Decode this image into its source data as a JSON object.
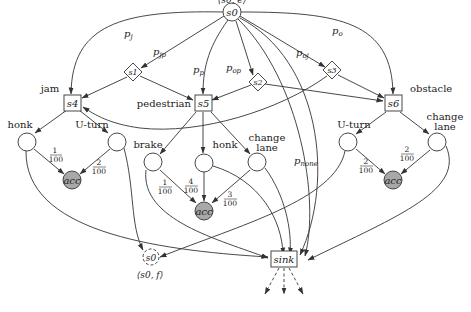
{
  "diagram": {
    "colors": {
      "stroke": "#333333",
      "acc_fill": "#a8a8a8",
      "background": "#ffffff"
    },
    "nodes": {
      "s0": {
        "label": "s0",
        "annotation": "⟨s0, e⟩",
        "shape": "circle"
      },
      "s1": {
        "label": "s1",
        "shape": "diamond"
      },
      "s2": {
        "label": "s2",
        "shape": "diamond"
      },
      "s3": {
        "label": "s3",
        "shape": "diamond"
      },
      "s4": {
        "label": "s4",
        "annotation": "jam",
        "shape": "square"
      },
      "s5": {
        "label": "s5",
        "annotation": "pedestrian",
        "shape": "square"
      },
      "s6": {
        "label": "s6",
        "annotation": "obstacle",
        "shape": "square"
      },
      "s0_final": {
        "label": "s0",
        "annotation": "⟨s0, f⟩",
        "shape": "dashed-circle"
      },
      "sink": {
        "label": "sink",
        "shape": "square"
      },
      "acc": {
        "label": "acc"
      }
    },
    "actions": {
      "jam": [
        {
          "label": "honk",
          "prob_num": "1",
          "prob_den": "100"
        },
        {
          "label": "U-turn",
          "prob_num": "2",
          "prob_den": "100"
        }
      ],
      "pedestrian": [
        {
          "label": "brake",
          "prob_num": "1",
          "prob_den": "100"
        },
        {
          "label": "honk",
          "prob_num": "4",
          "prob_den": "100"
        },
        {
          "label": "change",
          "label2": "lane",
          "prob_num": "3",
          "prob_den": "100"
        }
      ],
      "obstacle": [
        {
          "label": "U-turn",
          "prob_num": "2",
          "prob_den": "100"
        },
        {
          "label": "change",
          "label2": "lane",
          "prob_num": "2",
          "prob_den": "100"
        }
      ]
    },
    "edge_labels": {
      "pj": {
        "main": "p",
        "sub": "j"
      },
      "pjp": {
        "main": "p",
        "sub": "jp"
      },
      "pp": {
        "main": "p",
        "sub": "p"
      },
      "pop": {
        "main": "p",
        "sub": "op"
      },
      "poj": {
        "main": "p",
        "sub": "oj"
      },
      "po": {
        "main": "p",
        "sub": "o"
      },
      "pnone": {
        "main": "p",
        "sub": "none"
      }
    }
  }
}
